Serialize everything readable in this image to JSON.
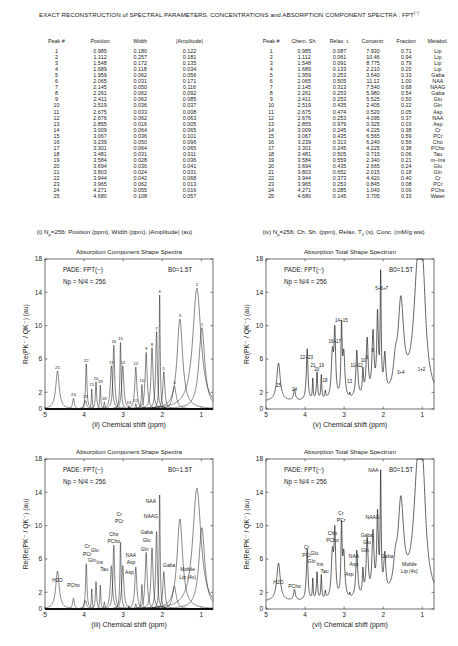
{
  "title": {
    "text": "EXACT RECONSTRUCTION of SPECTRAL PARAMETERS, CONCENTRATIONS and ABSORPTION COMPONENT SPECTRA : FPT",
    "sup": "(−)"
  },
  "table_left": {
    "headers": [
      "Peak #",
      "Position",
      "Width",
      "|Amplitude|"
    ],
    "rows": [
      [
        "1",
        "0.985",
        "0.180",
        "0.122"
      ],
      [
        "2",
        "1.112",
        "0.257",
        "0.181"
      ],
      [
        "3",
        "1.548",
        "0.172",
        "0.135"
      ],
      [
        "4",
        "1.689",
        "0.118",
        "0.034"
      ],
      [
        "5",
        "1.959",
        "0.062",
        "0.056"
      ],
      [
        "6",
        "2.065",
        "0.031",
        "0.171"
      ],
      [
        "7",
        "2.145",
        "0.050",
        "0.116"
      ],
      [
        "8",
        "2.261",
        "0.062",
        "0.092"
      ],
      [
        "9",
        "2.411",
        "0.062",
        "0.085"
      ],
      [
        "10",
        "2.519",
        "0.036",
        "0.037"
      ],
      [
        "11",
        "2.675",
        "0.033",
        "0.008"
      ],
      [
        "12",
        "2.676",
        "0.062",
        "0.063"
      ],
      [
        "13",
        "2.855",
        "0.016",
        "0.005"
      ],
      [
        "14",
        "3.009",
        "0.064",
        "0.065"
      ],
      [
        "15",
        "3.067",
        "0.036",
        "0.101"
      ],
      [
        "16",
        "3.239",
        "0.050",
        "0.096"
      ],
      [
        "17",
        "3.301",
        "0.064",
        "0.065"
      ],
      [
        "18",
        "3.481",
        "0.031",
        "0.011"
      ],
      [
        "19",
        "3.584",
        "0.028",
        "0.036"
      ],
      [
        "20",
        "3.694",
        "0.036",
        "0.041"
      ],
      [
        "21",
        "3.803",
        "0.024",
        "0.031"
      ],
      [
        "22",
        "3.944",
        "0.042",
        "0.068"
      ],
      [
        "23",
        "3.965",
        "0.062",
        "0.013"
      ],
      [
        "24",
        "4.271",
        "0.055",
        "0.016"
      ],
      [
        "25",
        "4.680",
        "0.108",
        "0.057"
      ]
    ],
    "caption": {
      "pre": "(i) N",
      "sub": "p",
      "post": "=256: Position (ppm), Width (ppm), |Amplitude| (au)"
    }
  },
  "table_right": {
    "headers": [
      "Peak #",
      "Chem. Sh.",
      "Relax. t.",
      "Concentr.",
      "Fraction",
      "Metabol."
    ],
    "rows": [
      [
        "1",
        "0.985",
        "0.087",
        "7.930",
        "0.71",
        "Lip"
      ],
      [
        "2",
        "1.112",
        "0.061",
        "10.46",
        "0.94",
        "Lip"
      ],
      [
        "3",
        "1.548",
        "0.091",
        "8.775",
        "0.79",
        "Lip"
      ],
      [
        "4",
        "1.689",
        "0.133",
        "2.210",
        "0.20",
        "Lip"
      ],
      [
        "5",
        "1.959",
        "0.253",
        "3.640",
        "0.33",
        "Gaba"
      ],
      [
        "6",
        "2.065",
        "0.505",
        "11.12",
        "1.00",
        "NAA"
      ],
      [
        "7",
        "2.145",
        "0.313",
        "7.540",
        "0.68",
        "NAAG"
      ],
      [
        "8",
        "2.261",
        "0.253",
        "5.980",
        "0.54",
        "Gaba"
      ],
      [
        "9",
        "2.411",
        "0.253",
        "5.525",
        "0.50",
        "Glu"
      ],
      [
        "10",
        "2.519",
        "0.435",
        "2.405",
        "0.22",
        "Gln"
      ],
      [
        "11",
        "2.675",
        "0.474",
        "0.520",
        "0.05",
        "Asp"
      ],
      [
        "12",
        "2.676",
        "0.253",
        "4.095",
        "0.37",
        "NAA"
      ],
      [
        "13",
        "2.855",
        "0.979",
        "0.325",
        "0.03",
        "Asp"
      ],
      [
        "14",
        "3.009",
        "0.245",
        "4.225",
        "0.38",
        "Cr"
      ],
      [
        "15",
        "3.067",
        "0.435",
        "6.565",
        "0.59",
        "PCr"
      ],
      [
        "16",
        "3.239",
        "0.313",
        "6.240",
        "0.56",
        "Cho"
      ],
      [
        "17",
        "3.301",
        "0.245",
        "4.225",
        "0.38",
        "PCho"
      ],
      [
        "18",
        "3.481",
        "0.505",
        "0.715",
        "0.06",
        "Tau"
      ],
      [
        "19",
        "3.584",
        "0.559",
        "2.340",
        "0.21",
        "m−Ins"
      ],
      [
        "20",
        "3.694",
        "0.435",
        "2.665",
        "0.24",
        "Glu"
      ],
      [
        "21",
        "3.803",
        "0.652",
        "2.015",
        "0.18",
        "Gln"
      ],
      [
        "22",
        "3.944",
        "0.373",
        "4.420",
        "0.40",
        "Cr"
      ],
      [
        "23",
        "3.965",
        "0.253",
        "0.845",
        "0.08",
        "PCr"
      ],
      [
        "24",
        "4.271",
        "0.285",
        "1.040",
        "0.09",
        "PCho"
      ],
      [
        "25",
        "4.680",
        "0.145",
        "3.705",
        "0.33",
        "Water"
      ]
    ],
    "caption": {
      "pre": "(iv) N",
      "sub": "p",
      "post": "=256: Ch. Sh. (ppm), Relax. T",
      "sub2": "2",
      "post2": " (s), Conc. (mM/g ww)"
    }
  },
  "chart_data": [
    {
      "id": "ii",
      "type": "line",
      "title": "Absorption Component Shape Spectra",
      "xlabel": "(ii)  Chemical shift (ppm)",
      "ylabel": "Re(P_K^- / Q_K^-) (au)",
      "xlim": [
        5,
        0.7
      ],
      "ylim": [
        0,
        18
      ],
      "xticks": [
        5,
        4,
        3,
        2,
        1
      ],
      "yticks": [
        0,
        2,
        6,
        10,
        14,
        18
      ],
      "annotations": [
        "PADE: FPT(−)",
        "Np = N/4 = 256",
        "B0=1.5T"
      ],
      "mode": "components",
      "peak_labels": [
        "1",
        "2",
        "3",
        "4",
        "5",
        "6",
        "7",
        "8",
        "9",
        "10",
        "11",
        "12",
        "13",
        "14",
        "15",
        "16",
        "17",
        "18",
        "19",
        "20",
        "21",
        "22",
        "23",
        "24",
        "25"
      ]
    },
    {
      "id": "v",
      "type": "line",
      "title": "Absorption Total Shape Spectrum",
      "xlabel": "(v)  Chemical shift (ppm)",
      "ylabel": "Re(P_K^- / Q_K^-) (au)",
      "xlim": [
        5,
        0.7
      ],
      "ylim": [
        0,
        18
      ],
      "xticks": [
        5,
        4,
        3,
        2,
        1
      ],
      "yticks": [
        0,
        2,
        6,
        10,
        14,
        18
      ],
      "annotations": [
        "PADE: FPT(−)",
        "Np = N/4 = 256",
        "B0=1.5T"
      ],
      "mode": "total",
      "group_labels": [
        {
          "x": 2.04,
          "y": 14.3,
          "t": "5+6+7"
        },
        {
          "x": 3.07,
          "y": 10.4,
          "t": "14+15"
        },
        {
          "x": 3.24,
          "y": 7.9,
          "t": "16+17"
        },
        {
          "x": 3.96,
          "y": 6.0,
          "t": "22+23"
        },
        {
          "x": 3.8,
          "y": 5.1,
          "t": "21"
        },
        {
          "x": 3.7,
          "y": 4.6,
          "t": "20"
        },
        {
          "x": 3.58,
          "y": 5.0,
          "t": "19"
        },
        {
          "x": 3.49,
          "y": 3.2,
          "t": "18"
        },
        {
          "x": 2.86,
          "y": 3.1,
          "t": "13"
        },
        {
          "x": 2.68,
          "y": 5.1,
          "t": "11+12"
        },
        {
          "x": 2.51,
          "y": 5.6,
          "t": "10"
        },
        {
          "x": 2.42,
          "y": 6.0,
          "t": "9"
        },
        {
          "x": 2.27,
          "y": 6.8,
          "t": "8"
        },
        {
          "x": 1.55,
          "y": 4.2,
          "t": "3+4"
        },
        {
          "x": 1.02,
          "y": 4.6,
          "t": "1+2"
        },
        {
          "x": 4.27,
          "y": 2.2,
          "t": "24"
        },
        {
          "x": 4.68,
          "y": 2.7,
          "t": "25"
        }
      ]
    },
    {
      "id": "iii",
      "type": "line",
      "title": "Absorption Component Shape Spectra",
      "xlabel": "(iii)  Chemical shift (ppm)",
      "ylabel": "Re(Re(P_K^- / Q_K^-) (au)",
      "xlim": [
        5,
        0.7
      ],
      "ylim": [
        0,
        18
      ],
      "xticks": [
        5,
        4,
        3,
        2,
        1
      ],
      "yticks": [
        0,
        2,
        6,
        10,
        14,
        18
      ],
      "annotations": [
        "PADE: FPT(−)",
        "Np = N/4 = 256",
        "B0=1.5T"
      ],
      "mode": "components",
      "metabolite_labels": [
        {
          "x": 4.68,
          "y": 3.2,
          "t": "H2O"
        },
        {
          "x": 4.27,
          "y": 2.6,
          "t": "PCho"
        },
        {
          "x": 3.92,
          "y": 7.3,
          "t": "Cr"
        },
        {
          "x": 3.92,
          "y": 6.4,
          "t": "PCr"
        },
        {
          "x": 3.73,
          "y": 6.8,
          "t": "Glu"
        },
        {
          "x": 3.8,
          "y": 5.7,
          "t": "Gln"
        },
        {
          "x": 3.6,
          "y": 5.4,
          "t": "Ins"
        },
        {
          "x": 3.48,
          "y": 4.6,
          "t": "Tau"
        },
        {
          "x": 3.1,
          "y": 11.2,
          "t": "Cr"
        },
        {
          "x": 3.1,
          "y": 10.3,
          "t": "PCr"
        },
        {
          "x": 3.24,
          "y": 8.8,
          "t": "Cho"
        },
        {
          "x": 3.24,
          "y": 7.9,
          "t": "PCho"
        },
        {
          "x": 2.8,
          "y": 6.3,
          "t": "NAA"
        },
        {
          "x": 2.8,
          "y": 5.4,
          "t": "Asp"
        },
        {
          "x": 2.84,
          "y": 4.2,
          "t": "Asp"
        },
        {
          "x": 2.4,
          "y": 9.0,
          "t": "Gaba"
        },
        {
          "x": 2.4,
          "y": 8.0,
          "t": "Glu"
        },
        {
          "x": 2.45,
          "y": 7.0,
          "t": "Gln"
        },
        {
          "x": 2.29,
          "y": 12.7,
          "t": "NAA"
        },
        {
          "x": 2.29,
          "y": 10.9,
          "t": "NAAG"
        },
        {
          "x": 1.82,
          "y": 5.1,
          "t": "Gaba"
        },
        {
          "x": 1.35,
          "y": 4.6,
          "t": "Mobile"
        },
        {
          "x": 1.35,
          "y": 3.6,
          "t": "Lip (4x)"
        }
      ]
    },
    {
      "id": "vi",
      "type": "line",
      "title": "Absorption Total Shape Spectrum",
      "xlabel": "(vi)  Chemical shift (ppm)",
      "ylabel": "Re(Re(P_K^- / Q_K^-) (au)",
      "xlim": [
        5,
        0.7
      ],
      "ylim": [
        0,
        18
      ],
      "xticks": [
        5,
        4,
        3,
        2,
        1
      ],
      "yticks": [
        0,
        2,
        6,
        10,
        14,
        18
      ],
      "annotations": [
        "PADE: FPT(−)",
        "Np = N/4 = 256",
        "B0=1.5T"
      ],
      "mode": "total",
      "metabolite_labels": [
        {
          "x": 4.68,
          "y": 3.0,
          "t": "H2O"
        },
        {
          "x": 4.27,
          "y": 2.5,
          "t": "PCho"
        },
        {
          "x": 3.96,
          "y": 7.2,
          "t": "Cr"
        },
        {
          "x": 3.96,
          "y": 6.2,
          "t": "PCr"
        },
        {
          "x": 3.76,
          "y": 6.5,
          "t": "Glu"
        },
        {
          "x": 3.83,
          "y": 5.5,
          "t": "Gln"
        },
        {
          "x": 3.62,
          "y": 5.2,
          "t": "Ins"
        },
        {
          "x": 3.5,
          "y": 4.3,
          "t": "Tau"
        },
        {
          "x": 3.08,
          "y": 11.3,
          "t": "Cr"
        },
        {
          "x": 3.08,
          "y": 10.4,
          "t": "PCr"
        },
        {
          "x": 3.3,
          "y": 8.9,
          "t": "Cho"
        },
        {
          "x": 3.3,
          "y": 8.0,
          "t": "PCho"
        },
        {
          "x": 2.75,
          "y": 6.1,
          "t": "NAA"
        },
        {
          "x": 2.75,
          "y": 5.2,
          "t": "Asp"
        },
        {
          "x": 2.87,
          "y": 4.0,
          "t": "Asp"
        },
        {
          "x": 2.42,
          "y": 8.7,
          "t": "Gaba"
        },
        {
          "x": 2.42,
          "y": 7.8,
          "t": "Glu"
        },
        {
          "x": 2.47,
          "y": 6.8,
          "t": "Gln"
        },
        {
          "x": 2.25,
          "y": 16.4,
          "t": "NAA"
        },
        {
          "x": 2.27,
          "y": 10.8,
          "t": "NAAG"
        },
        {
          "x": 1.9,
          "y": 6.1,
          "t": "Gaba"
        },
        {
          "x": 1.33,
          "y": 5.2,
          "t": "Mobile"
        },
        {
          "x": 1.33,
          "y": 4.3,
          "t": "Lip (4x)"
        }
      ]
    }
  ]
}
